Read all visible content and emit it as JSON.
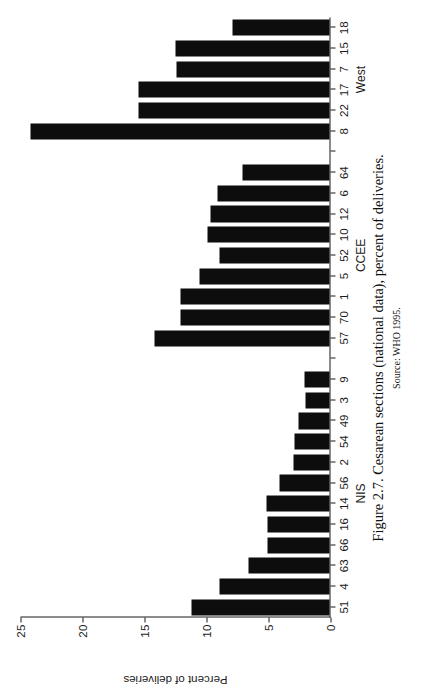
{
  "figure": {
    "caption": "Figure 2.7. Cesarean sections (national data), percent of deliveries.",
    "source": "Source: WHO 1995."
  },
  "chart_data": {
    "type": "bar",
    "orientation": "vertical",
    "title": "",
    "xlabel": "",
    "ylabel": "Percent of deliveries",
    "ylim": [
      0,
      25
    ],
    "yticks": [
      0,
      5,
      10,
      15,
      20,
      25
    ],
    "ytick_labels": [
      "0",
      "5",
      "10",
      "15",
      "20",
      "25"
    ],
    "grid": false,
    "legend": false,
    "bar_color": "#0d0d0d",
    "axis_color": "#1a1a1a",
    "groups": [
      {
        "name": "NIS",
        "start_index": 0,
        "end_index": 11
      },
      {
        "name": "CCEE",
        "start_index": 13,
        "end_index": 21
      },
      {
        "name": "West",
        "start_index": 23,
        "end_index": 28
      }
    ],
    "categories": [
      "51",
      "4",
      "63",
      "66",
      "16",
      "14",
      "56",
      "2",
      "54",
      "49",
      "3",
      "9",
      "",
      "57",
      "70",
      "1",
      "5",
      "52",
      "10",
      "12",
      "6",
      "64",
      "",
      "8",
      "22",
      "17",
      "7",
      "15",
      "18"
    ],
    "values": [
      11.1,
      8.9,
      6.5,
      5.0,
      5.0,
      5.1,
      4.0,
      2.9,
      2.8,
      2.5,
      1.9,
      2.0,
      0,
      14.1,
      12.0,
      12.0,
      10.5,
      8.9,
      9.8,
      9.6,
      9.0,
      7.0,
      0,
      24.1,
      15.4,
      15.4,
      12.3,
      12.4,
      7.8
    ],
    "series": [
      {
        "name": "Percent of deliveries",
        "values": [
          11.1,
          8.9,
          6.5,
          5.0,
          5.0,
          5.1,
          4.0,
          2.9,
          2.8,
          2.5,
          1.9,
          2.0,
          0,
          14.1,
          12.0,
          12.0,
          10.5,
          8.9,
          9.8,
          9.6,
          9.0,
          7.0,
          0,
          24.1,
          15.4,
          15.4,
          12.3,
          12.4,
          7.8
        ]
      }
    ]
  }
}
